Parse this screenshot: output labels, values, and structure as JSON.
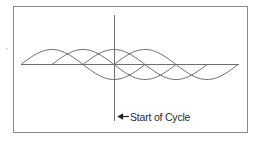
{
  "diagram": {
    "title": "",
    "annotation": {
      "label": "Start of Cycle",
      "icon": "left-arrow-icon"
    },
    "frame": {
      "x": 13,
      "y": 6,
      "width": 234,
      "height": 126
    },
    "baseline": {
      "y": 64,
      "x_start": 21,
      "x_end": 239
    },
    "marker_line": {
      "x": 114,
      "y_start": 15,
      "y_end": 121
    },
    "waves": [
      {
        "name": "wave-1",
        "start_x": 21,
        "half_period": 62,
        "amplitude": 15,
        "half_cycles": 2
      },
      {
        "name": "wave-2",
        "start_x": 52,
        "half_period": 62,
        "amplitude": 15,
        "half_cycles": 2
      },
      {
        "name": "wave-3",
        "start_x": 83,
        "half_period": 62,
        "amplitude": 15,
        "half_cycles": 2
      },
      {
        "name": "wave-4",
        "start_x": 114,
        "half_period": 62,
        "amplitude": 15,
        "half_cycles": 2
      }
    ],
    "colors": {
      "frame": "#8a8a8a",
      "waves": "#6a6a6a",
      "text": "#2a2a2a"
    }
  }
}
